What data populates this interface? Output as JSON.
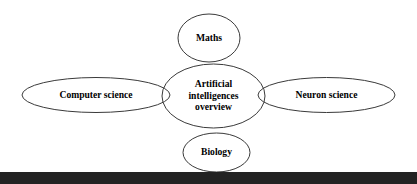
{
  "diagram": {
    "type": "hub-and-spoke-ellipse-diagram",
    "background_color": "#ffffff",
    "stroke_color": "#3a3a3a",
    "text_color": "#000000",
    "center": {
      "id": "center-node",
      "label_line_1": "Artificial",
      "label_line_2": "intelligences",
      "label_line_3": "overview",
      "label_full": "Artificial intelligences overview"
    },
    "nodes": [
      {
        "id": "node-maths",
        "position": "top",
        "label": "Maths"
      },
      {
        "id": "node-computer-science",
        "position": "left",
        "label": "Computer science"
      },
      {
        "id": "node-neuron-science",
        "position": "right",
        "label": "Neuron science"
      },
      {
        "id": "node-biology",
        "position": "bottom",
        "label": "Biology"
      }
    ]
  },
  "footer": {
    "bar_color": "#232323"
  }
}
